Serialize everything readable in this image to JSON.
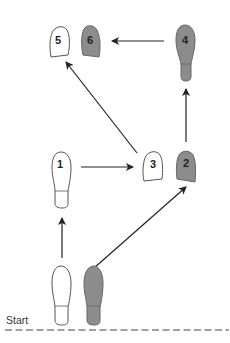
{
  "diagram": {
    "start_label": "Start",
    "colors": {
      "left_foot_fill": "#ffffff",
      "right_foot_fill": "#8c8c8c",
      "outline": "#555555",
      "arrow": "#222222",
      "dashed_line": "#444444"
    },
    "steps": [
      {
        "number": "1",
        "foot": "left",
        "shape": "full",
        "fill": "white"
      },
      {
        "number": "2",
        "foot": "right",
        "shape": "ball",
        "fill": "gray"
      },
      {
        "number": "3",
        "foot": "left",
        "shape": "ball",
        "fill": "white"
      },
      {
        "number": "4",
        "foot": "right",
        "shape": "full",
        "fill": "gray"
      },
      {
        "number": "5",
        "foot": "left",
        "shape": "ball",
        "fill": "white"
      },
      {
        "number": "6",
        "foot": "right",
        "shape": "ball",
        "fill": "gray"
      }
    ],
    "start_feet": [
      {
        "foot": "left",
        "shape": "full",
        "fill": "white"
      },
      {
        "foot": "right",
        "shape": "full",
        "fill": "gray"
      }
    ],
    "arrows": [
      {
        "from": "start-left",
        "to": "1"
      },
      {
        "from": "start-right",
        "to": "2"
      },
      {
        "from": "1",
        "to": "3"
      },
      {
        "from": "2",
        "to": "4"
      },
      {
        "from": "3",
        "to": "5"
      },
      {
        "from": "4",
        "to": "6"
      }
    ]
  }
}
